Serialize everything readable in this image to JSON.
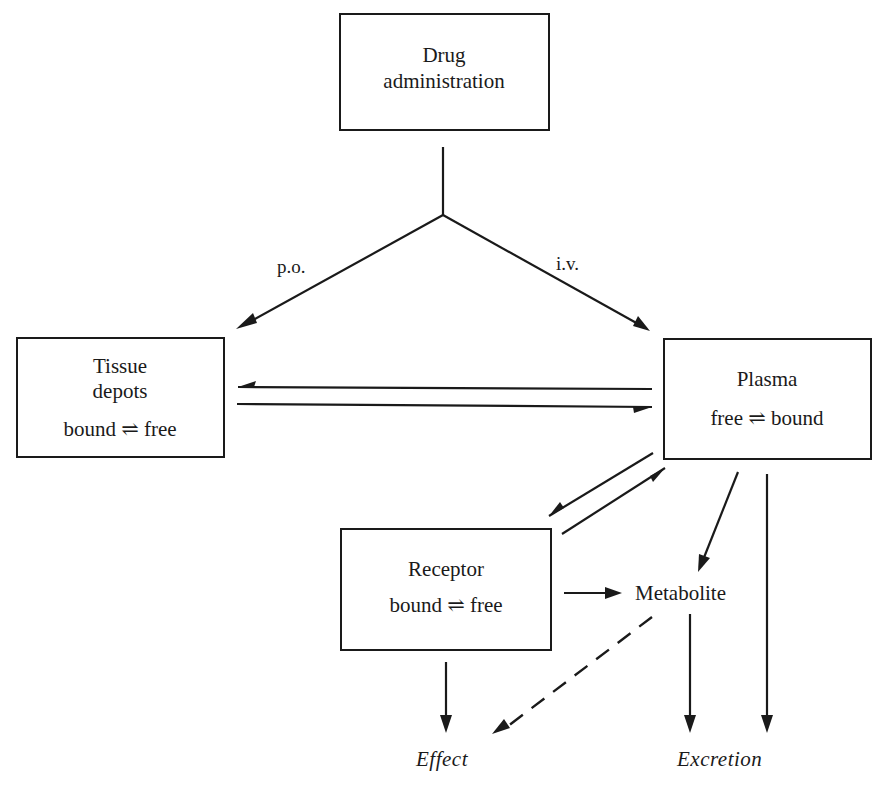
{
  "diagram": {
    "nodes": {
      "drug_admin": {
        "line1": "Drug",
        "line2": "administration"
      },
      "tissue": {
        "line1": "Tissue",
        "line2": "depots",
        "line3": "bound ⇌ free"
      },
      "plasma": {
        "line1": "Plasma",
        "line2": "free ⇌ bound"
      },
      "receptor": {
        "line1": "Receptor",
        "line2": "bound ⇌ free"
      },
      "metabolite": {
        "label": "Metabolite"
      },
      "effect": {
        "label": "Effect"
      },
      "excretion": {
        "label": "Excretion"
      }
    },
    "edge_labels": {
      "oral": "p.o.",
      "intravenous": "i.v."
    },
    "edges": [
      {
        "from": "drug_admin",
        "to": "tissue",
        "label": "p.o.",
        "style": "solid"
      },
      {
        "from": "drug_admin",
        "to": "plasma",
        "label": "i.v.",
        "style": "solid"
      },
      {
        "from": "plasma",
        "to": "tissue",
        "style": "solid"
      },
      {
        "from": "tissue",
        "to": "plasma",
        "style": "solid"
      },
      {
        "from": "plasma",
        "to": "receptor",
        "style": "solid"
      },
      {
        "from": "receptor",
        "to": "plasma",
        "style": "solid"
      },
      {
        "from": "plasma",
        "to": "metabolite",
        "style": "solid"
      },
      {
        "from": "plasma",
        "to": "excretion",
        "style": "solid"
      },
      {
        "from": "receptor",
        "to": "metabolite",
        "style": "solid"
      },
      {
        "from": "receptor",
        "to": "effect",
        "style": "solid"
      },
      {
        "from": "metabolite",
        "to": "effect",
        "style": "dashed"
      },
      {
        "from": "metabolite",
        "to": "excretion",
        "style": "solid"
      }
    ],
    "colors": {
      "ink": "#1a1a1a",
      "background": "#ffffff"
    }
  }
}
